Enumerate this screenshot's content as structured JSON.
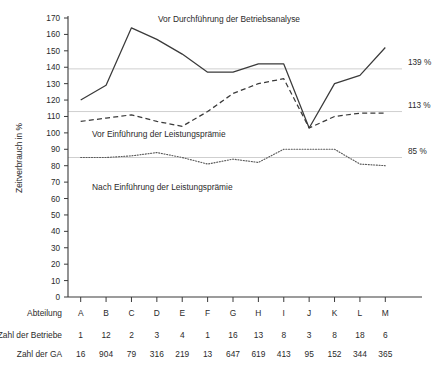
{
  "chart_data": {
    "type": "line",
    "title": "",
    "xlabel": "Abteilung",
    "ylabel": "Zeitverbrauch in %",
    "ylim": [
      0,
      170
    ],
    "ytick_step": 10,
    "grid": false,
    "legend_position": "inline-annotations",
    "categories": [
      "A",
      "B",
      "C",
      "D",
      "E",
      "F",
      "G",
      "H",
      "I",
      "J",
      "K",
      "L",
      "M"
    ],
    "series": [
      {
        "name": "Vor Durchführung der Betriebsanalyse",
        "style": "solid",
        "values": [
          120,
          129,
          164,
          157,
          148,
          137,
          137,
          142,
          142,
          103,
          130,
          135,
          152
        ]
      },
      {
        "name": "Vor Einführung der Leistungsprämie",
        "style": "dashed",
        "values": [
          107,
          109,
          111,
          107,
          104,
          113,
          124,
          130,
          133,
          103,
          110,
          112,
          112
        ]
      },
      {
        "name": "Nach Einführung der Leistungsprämie",
        "style": "dotted",
        "values": [
          85,
          85,
          86,
          88,
          85,
          81,
          84,
          82,
          90,
          90,
          90,
          81,
          80
        ]
      }
    ],
    "reference_lines": [
      {
        "value": 139,
        "label": "139 %"
      },
      {
        "value": 113,
        "label": "113 %"
      },
      {
        "value": 85,
        "label": "85 %"
      }
    ],
    "ytick_labels": [
      "0",
      "10",
      "20",
      "30",
      "40",
      "50",
      "60",
      "70",
      "80",
      "90",
      "100",
      "110",
      "120",
      "130",
      "140",
      "150",
      "160",
      "170"
    ]
  },
  "annotations": [
    {
      "text": "Vor Durchführung der Betriebsanalyse"
    },
    {
      "text": "Vor Einführung der Leistungsprämie"
    },
    {
      "text": "Nach Einführung der Leistungsprämie"
    }
  ],
  "table": {
    "row_headers": [
      "Abteilung",
      "Zahl der Betriebe",
      "Zahl der GA"
    ],
    "rows": [
      [
        "A",
        "B",
        "C",
        "D",
        "E",
        "F",
        "G",
        "H",
        "I",
        "J",
        "K",
        "L",
        "M"
      ],
      [
        "1",
        "12",
        "2",
        "3",
        "4",
        "1",
        "16",
        "13",
        "8",
        "3",
        "8",
        "18",
        "6"
      ],
      [
        "16",
        "904",
        "79",
        "316",
        "219",
        "13",
        "647",
        "619",
        "413",
        "95",
        "152",
        "344",
        "365"
      ]
    ]
  },
  "colors": {
    "ink": "#2b2b2b",
    "axis": "#3a3a3a",
    "reference": "#c9c9c9",
    "background": "#ffffff"
  }
}
